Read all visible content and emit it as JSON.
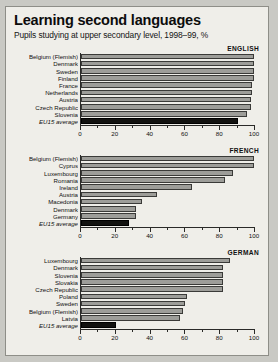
{
  "header": {
    "title": "Learning second languages",
    "subtitle": "Pupils studying at upper secondary level, 1998–99, %"
  },
  "chart_data": {
    "type": "bar",
    "title": "Learning second languages",
    "subtitle": "Pupils studying at upper secondary level, 1998–99, %",
    "xlabel": "",
    "ylabel": "",
    "xlim": [
      0,
      100
    ],
    "ticks": [
      0,
      20,
      40,
      60,
      80,
      100
    ],
    "minor_tick_step": 10,
    "grid": false,
    "orientation": "horizontal",
    "legend": "none",
    "colors": {
      "bar": "#9d9d99",
      "average_bar": "#121210",
      "background": "#efeee9",
      "axis": "#2a2a28",
      "page_background": "#c9c9c4"
    },
    "panels": [
      {
        "name": "ENGLISH",
        "categories": [
          "Belgium (Flemish)",
          "Denmark",
          "Sweden",
          "Finland",
          "France",
          "Netherlands",
          "Austria",
          "Czech Republic",
          "Slovenia",
          "EU15 average"
        ],
        "values": [
          100,
          100,
          100,
          100,
          99,
          99,
          98,
          98,
          96,
          91
        ],
        "average_index": 9
      },
      {
        "name": "FRENCH",
        "categories": [
          "Belgium (Flemish)",
          "Cyprus",
          "Luxembourg",
          "Romania",
          "Ireland",
          "Austria",
          "Macedonia",
          "Denmark",
          "Germany",
          "EU15 average"
        ],
        "values": [
          100,
          100,
          88,
          83,
          64,
          44,
          35,
          32,
          32,
          28
        ],
        "average_index": 9
      },
      {
        "name": "GERMAN",
        "categories": [
          "Luxembourg",
          "Denmark",
          "Slovenia",
          "Slovakia",
          "Czech Republic",
          "Poland",
          "Sweden",
          "Belgium (Flemish)",
          "Latvia",
          "EU15 average"
        ],
        "values": [
          86,
          82,
          82,
          82,
          82,
          61,
          60,
          59,
          57,
          20
        ],
        "average_index": 9
      }
    ]
  }
}
